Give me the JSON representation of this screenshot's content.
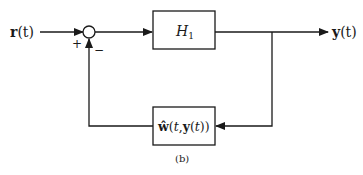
{
  "diagram": {
    "input_label": {
      "bold": "r",
      "rest": "(t)"
    },
    "output_label": {
      "bold": "y",
      "rest": "(t)"
    },
    "forward_block": {
      "name": "H",
      "subscript": "1"
    },
    "feedback_block": {
      "hat": "ŵ",
      "text1": "(",
      "t1": "t",
      "comma": ",",
      "bold_y": "y",
      "text2": "(",
      "t2": "t",
      "text3": "))"
    },
    "summing_junction": {
      "plus_sign": "+",
      "minus_sign": "−"
    },
    "caption": "(b)"
  },
  "colors": {
    "stroke": "#1a1a1a",
    "background": "#ffffff"
  }
}
